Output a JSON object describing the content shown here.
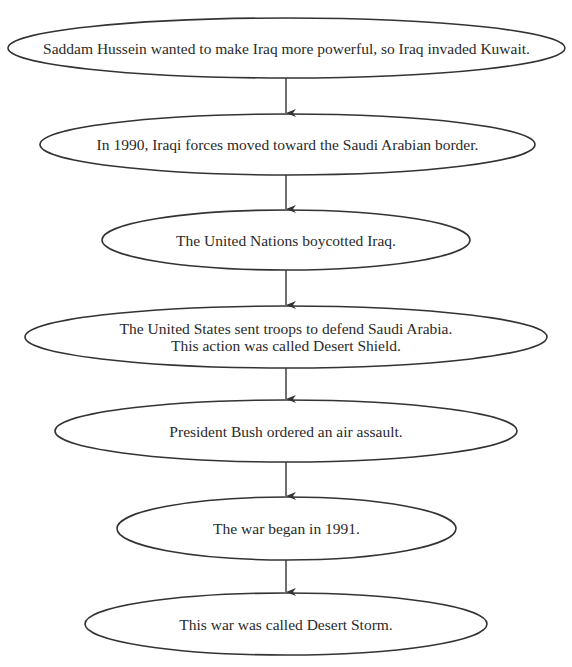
{
  "diagram": {
    "type": "flowchart",
    "direction": "top-to-bottom",
    "stroke_color": "#333333",
    "nodes": [
      {
        "id": "n1",
        "lines": [
          "Saddam Hussein wanted to make Iraq more powerful, so Iraq invaded Kuwait."
        ],
        "box": [
          8,
          18,
          557,
          60
        ]
      },
      {
        "id": "n2",
        "lines": [
          "In 1990, Iraqi forces moved toward the Saudi Arabian border."
        ],
        "box": [
          40,
          114,
          495,
          61
        ]
      },
      {
        "id": "n3",
        "lines": [
          "The United Nations boycotted Iraq."
        ],
        "box": [
          102,
          210,
          368,
          60
        ]
      },
      {
        "id": "n4",
        "lines": [
          "The United States sent troops to defend Saudi Arabia.",
          "This action was called Desert Shield."
        ],
        "box": [
          25,
          306,
          522,
          62
        ]
      },
      {
        "id": "n5",
        "lines": [
          "President Bush ordered an air assault."
        ],
        "box": [
          55,
          400,
          462,
          62
        ]
      },
      {
        "id": "n6",
        "lines": [
          "The war began in 1991."
        ],
        "box": [
          117,
          497,
          339,
          63
        ]
      },
      {
        "id": "n7",
        "lines": [
          "This war was called Desert Storm."
        ],
        "box": [
          85,
          593,
          402,
          62
        ]
      }
    ],
    "edges": [
      {
        "from": "n1",
        "to": "n2"
      },
      {
        "from": "n2",
        "to": "n3"
      },
      {
        "from": "n3",
        "to": "n4"
      },
      {
        "from": "n4",
        "to": "n5"
      },
      {
        "from": "n5",
        "to": "n6"
      },
      {
        "from": "n6",
        "to": "n7"
      }
    ]
  }
}
